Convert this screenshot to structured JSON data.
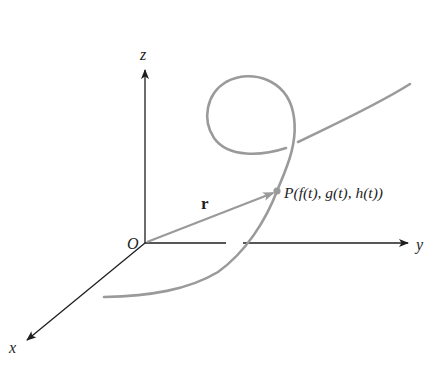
{
  "diagram": {
    "axes": {
      "z_label": "z",
      "y_label": "y",
      "x_label": "x",
      "origin_label": "O"
    },
    "vector": {
      "label": "r"
    },
    "point": {
      "label": "P(f(t), g(t), h(t))"
    },
    "colors": {
      "axis": "#1e1e1e",
      "curve": "#9a9a9a",
      "background": "#ffffff"
    }
  }
}
